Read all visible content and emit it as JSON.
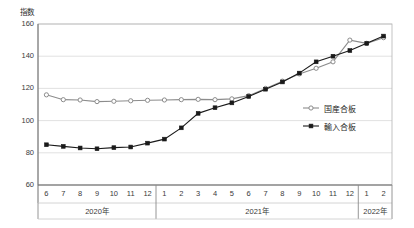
{
  "chart_data": {
    "type": "line",
    "title": "",
    "ylabel": "指数",
    "xlabel": "",
    "ylim": [
      60,
      160
    ],
    "yticks": [
      60,
      80,
      100,
      120,
      140,
      160
    ],
    "grid": true,
    "legend_position": "right-middle",
    "x": [
      "6",
      "7",
      "8",
      "9",
      "10",
      "11",
      "12",
      "1",
      "2",
      "3",
      "4",
      "5",
      "6",
      "7",
      "8",
      "9",
      "10",
      "11",
      "12",
      "1",
      "2"
    ],
    "year_groups": [
      {
        "label": "2020年",
        "months": [
          "6",
          "7",
          "8",
          "9",
          "10",
          "11",
          "12"
        ]
      },
      {
        "label": "2021年",
        "months": [
          "1",
          "2",
          "3",
          "4",
          "5",
          "6",
          "7",
          "8",
          "9",
          "10",
          "11",
          "12"
        ]
      },
      {
        "label": "2022年",
        "months": [
          "1",
          "2"
        ]
      }
    ],
    "series": [
      {
        "name": "国産合板",
        "marker": "open-circle",
        "color": "#8c8c8c",
        "values": [
          116.0,
          113.0,
          112.8,
          111.8,
          112.0,
          112.3,
          112.6,
          112.8,
          113.0,
          113.2,
          113.0,
          113.5,
          115.5,
          120.0,
          124.5,
          129.0,
          132.5,
          136.5,
          150.0,
          148.0,
          151.5
        ]
      },
      {
        "name": "輸入合板",
        "marker": "filled-square",
        "color": "#1a1a1a",
        "values": [
          85.0,
          84.0,
          83.0,
          82.5,
          83.2,
          83.6,
          86.0,
          88.5,
          95.5,
          104.5,
          108.0,
          111.0,
          115.0,
          119.5,
          124.0,
          129.5,
          136.5,
          140.0,
          143.5,
          148.0,
          152.5
        ]
      }
    ]
  },
  "legend": {
    "items": [
      {
        "label": "国産合板"
      },
      {
        "label": "輸入合板"
      }
    ]
  },
  "axis": {
    "y_unit_label": "指数"
  }
}
